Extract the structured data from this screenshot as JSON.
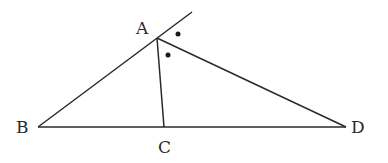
{
  "diagram": {
    "type": "geometry",
    "points": {
      "A": {
        "label": "A",
        "x": 157,
        "y": 38
      },
      "B": {
        "label": "B",
        "x": 38,
        "y": 127
      },
      "C": {
        "label": "C",
        "x": 164,
        "y": 127
      },
      "D": {
        "label": "D",
        "x": 346,
        "y": 127
      }
    },
    "segments": [
      "BA (extended beyond A)",
      "AC",
      "AD",
      "BD"
    ],
    "angle_marks": [
      "dot between extension of BA and AD",
      "dot between AC and AD"
    ],
    "colors": {
      "stroke": "#2a2a2a",
      "background": "#ffffff"
    }
  }
}
